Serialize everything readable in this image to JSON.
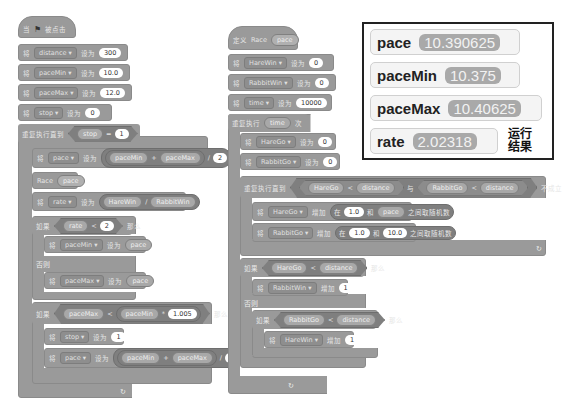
{
  "script_main": {
    "hat": {
      "prefix": "当",
      "flag_icon": "green-flag-icon",
      "suffix": "被点击"
    },
    "init": [
      {
        "verb": "将",
        "var": "distance",
        "set": "设为",
        "value": "300"
      },
      {
        "verb": "将",
        "var": "paceMin",
        "set": "设为",
        "value": "10.0"
      },
      {
        "verb": "将",
        "var": "paceMax",
        "set": "设为",
        "value": "12.0"
      },
      {
        "verb": "将",
        "var": "stop",
        "set": "设为",
        "value": "0"
      }
    ],
    "loop": {
      "label": "重复执行直到",
      "left": "stop",
      "op": "=",
      "right": "1"
    },
    "set_pace": {
      "verb": "将",
      "var": "pace",
      "set": "设为",
      "a": "paceMin",
      "plus": "+",
      "b": "paceMax",
      "div": "/",
      "c": "2"
    },
    "race_call": {
      "name": "Race",
      "arg": "pace"
    },
    "set_rate": {
      "verb": "将",
      "var": "rate",
      "set": "设为",
      "a": "HareWin",
      "div": "/",
      "b": "RabbitWin"
    },
    "if1": {
      "label": "如果",
      "left": "rate",
      "op": "<",
      "right": "2",
      "then": "那么",
      "else": "否则"
    },
    "if1_then": {
      "verb": "将",
      "var": "paceMin",
      "set": "设为",
      "value": "pace"
    },
    "if1_else": {
      "verb": "将",
      "var": "paceMax",
      "set": "设为",
      "value": "pace"
    },
    "if2": {
      "label": "如果",
      "left": "paceMax",
      "op": "<",
      "mid": "paceMin",
      "mul": "*",
      "right": "1.005",
      "then": "那么"
    },
    "if2_stop": {
      "verb": "将",
      "var": "stop",
      "set": "设为",
      "value": "1"
    },
    "if2_pace": {
      "verb": "将",
      "var": "pace",
      "set": "设为",
      "a": "paceMin",
      "plus": "+",
      "b": "paceMax",
      "div": "/",
      "c": "2"
    },
    "loop_arrow": "↻"
  },
  "script_race": {
    "define": {
      "label": "定义",
      "name": "Race",
      "param": "pace"
    },
    "init": [
      {
        "verb": "将",
        "var": "HareWin",
        "set": "设为",
        "value": "0"
      },
      {
        "verb": "将",
        "var": "RabbitWin",
        "set": "设为",
        "value": "0"
      },
      {
        "verb": "将",
        "var": "time",
        "set": "设为",
        "value": "10000"
      }
    ],
    "repeat": {
      "label": "重复执行",
      "count": "time",
      "suffix": "次"
    },
    "reset": [
      {
        "verb": "将",
        "var": "HareGo",
        "set": "设为",
        "value": "0"
      },
      {
        "verb": "将",
        "var": "RabbitGo",
        "set": "设为",
        "value": "0"
      }
    ],
    "until": {
      "label": "重复执行直到",
      "a": "HareGo",
      "lt1": "<",
      "b": "distance",
      "and": "与",
      "c": "RabbitGo",
      "lt2": "<",
      "d": "distance",
      "suffix": "不成立"
    },
    "step_hare": {
      "verb": "将",
      "var": "HareGo",
      "inc": "增加",
      "in": "在",
      "low": "1.0",
      "and": "和",
      "high": "pace",
      "suffix": "之间取随机数"
    },
    "step_rabbit": {
      "verb": "将",
      "var": "RabbitGo",
      "inc": "增加",
      "in": "在",
      "low": "1.0",
      "and": "和",
      "high": "10.0",
      "suffix": "之间取随机数"
    },
    "if1": {
      "label": "如果",
      "left": "HareGo",
      "op": "<",
      "right": "distance",
      "then": "那么",
      "else": "否则"
    },
    "if1_then": {
      "verb": "将",
      "var": "RabbitWin",
      "inc": "增加",
      "value": "1"
    },
    "if2": {
      "label": "如果",
      "left": "RabbitGo",
      "op": "<",
      "right": "distance",
      "then": "那么"
    },
    "if2_then": {
      "verb": "将",
      "var": "HareWin",
      "inc": "增加",
      "value": "1"
    },
    "loop_arrow": "↻"
  },
  "monitors": [
    {
      "name": "pace",
      "value": "10.390625"
    },
    {
      "name": "paceMin",
      "value": "10.375"
    },
    {
      "name": "paceMax",
      "value": "10.40625"
    },
    {
      "name": "rate",
      "value": "2.02318"
    }
  ],
  "result_note": {
    "line1": "运行",
    "line2": "结果"
  }
}
